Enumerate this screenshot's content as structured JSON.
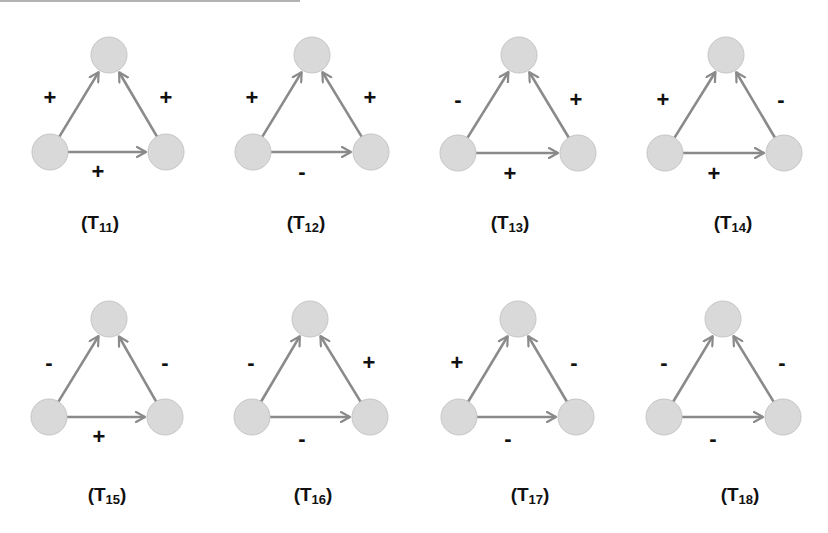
{
  "figure": {
    "style": {
      "node_fill": "#d9d9d9",
      "node_stroke": "#c6c6c6",
      "edge_color": "#8a8a8a",
      "sign_color": "#111111",
      "node_radius": 18
    },
    "header": {
      "visible_text": ""
    },
    "triads": [
      {
        "id": "T11",
        "prefix": "(T",
        "subscript": "11",
        "suffix": ")",
        "nodes": {
          "top": [
            109,
            55
          ],
          "bl": [
            50,
            152
          ],
          "br": [
            166,
            152
          ]
        },
        "signs": {
          "left": "+",
          "right": "+",
          "bottom": "+"
        },
        "sign_pos": {
          "left": [
            50,
            98
          ],
          "right": [
            166,
            98
          ],
          "bottom": [
            98,
            172
          ]
        },
        "label_pos": [
          100,
          222
        ]
      },
      {
        "id": "T12",
        "prefix": "(T",
        "subscript": "12",
        "suffix": ")",
        "nodes": {
          "top": [
            312,
            55
          ],
          "bl": [
            253,
            152
          ],
          "br": [
            371,
            152
          ]
        },
        "signs": {
          "left": "+",
          "right": "+",
          "bottom": "-"
        },
        "sign_pos": {
          "left": [
            252,
            98
          ],
          "right": [
            370,
            98
          ],
          "bottom": [
            302,
            172
          ]
        },
        "label_pos": [
          306,
          222
        ]
      },
      {
        "id": "T13",
        "prefix": "(T",
        "subscript": "13",
        "suffix": ")",
        "nodes": {
          "top": [
            519,
            55
          ],
          "bl": [
            458,
            153
          ],
          "br": [
            578,
            153
          ]
        },
        "signs": {
          "left": "-",
          "right": "+",
          "bottom": "+"
        },
        "sign_pos": {
          "left": [
            458,
            100
          ],
          "right": [
            576,
            100
          ],
          "bottom": [
            510,
            174
          ]
        },
        "label_pos": [
          510,
          222
        ]
      },
      {
        "id": "T14",
        "prefix": "(T",
        "subscript": "14",
        "suffix": ")",
        "nodes": {
          "top": [
            726,
            55
          ],
          "bl": [
            665,
            153
          ],
          "br": [
            784,
            153
          ]
        },
        "signs": {
          "left": "+",
          "right": "-",
          "bottom": "+"
        },
        "sign_pos": {
          "left": [
            663,
            100
          ],
          "right": [
            781,
            100
          ],
          "bottom": [
            714,
            174
          ]
        },
        "label_pos": [
          733,
          222
        ]
      },
      {
        "id": "T15",
        "prefix": "(T",
        "subscript": "15",
        "suffix": ")",
        "nodes": {
          "top": [
            109,
            319
          ],
          "bl": [
            49,
            417
          ],
          "br": [
            165,
            417
          ]
        },
        "signs": {
          "left": "-",
          "right": "-",
          "bottom": "+"
        },
        "sign_pos": {
          "left": [
            49,
            363
          ],
          "right": [
            165,
            363
          ],
          "bottom": [
            99,
            437
          ]
        },
        "label_pos": [
          107,
          494
        ]
      },
      {
        "id": "T16",
        "prefix": "(T",
        "subscript": "16",
        "suffix": ")",
        "nodes": {
          "top": [
            310,
            319
          ],
          "bl": [
            252,
            417
          ],
          "br": [
            370,
            417
          ]
        },
        "signs": {
          "left": "-",
          "right": "+",
          "bottom": "-"
        },
        "sign_pos": {
          "left": [
            251,
            363
          ],
          "right": [
            369,
            363
          ],
          "bottom": [
            302,
            439
          ]
        },
        "label_pos": [
          313,
          494
        ]
      },
      {
        "id": "T17",
        "prefix": "(T",
        "subscript": "17",
        "suffix": ")",
        "nodes": {
          "top": [
            518,
            319
          ],
          "bl": [
            459,
            417
          ],
          "br": [
            576,
            417
          ]
        },
        "signs": {
          "left": "+",
          "right": "-",
          "bottom": "-"
        },
        "sign_pos": {
          "left": [
            457,
            363
          ],
          "right": [
            574,
            363
          ],
          "bottom": [
            508,
            439
          ]
        },
        "label_pos": [
          530,
          494
        ]
      },
      {
        "id": "T18",
        "prefix": "(T",
        "subscript": "18",
        "suffix": ")",
        "nodes": {
          "top": [
            723,
            319
          ],
          "bl": [
            664,
            417
          ],
          "br": [
            783,
            417
          ]
        },
        "signs": {
          "left": "-",
          "right": "-",
          "bottom": "-"
        },
        "sign_pos": {
          "left": [
            664,
            363
          ],
          "right": [
            782,
            363
          ],
          "bottom": [
            713,
            439
          ]
        },
        "label_pos": [
          740,
          494
        ]
      }
    ]
  }
}
